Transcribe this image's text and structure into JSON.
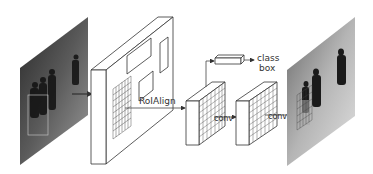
{
  "diagram": {
    "type": "architecture-pipeline",
    "nodes": [
      {
        "id": "input-image",
        "kind": "photo",
        "description": "grayscale soccer players input image"
      },
      {
        "id": "feature-map",
        "kind": "3d-block",
        "description": "backbone feature map with region proposals and grid"
      },
      {
        "id": "roi-feature-1",
        "kind": "3d-block-grid"
      },
      {
        "id": "roi-feature-2",
        "kind": "3d-block-grid"
      },
      {
        "id": "fc-head",
        "kind": "thin-3d-box"
      },
      {
        "id": "output-image",
        "kind": "photo",
        "description": "grayscale output image with instance mask"
      }
    ],
    "labels": {
      "roialign": "RoIAlign",
      "conv1": "conv",
      "conv2": "conv",
      "class": "class",
      "box": "box"
    },
    "edges": [
      {
        "from": "input-image",
        "to": "feature-map"
      },
      {
        "from": "feature-map",
        "to": "roi-feature-1",
        "label": "RoIAlign"
      },
      {
        "from": "roi-feature-1",
        "to": "fc-head"
      },
      {
        "from": "fc-head",
        "to": "class/box"
      },
      {
        "from": "roi-feature-1",
        "to": "roi-feature-2",
        "label": "conv"
      },
      {
        "from": "roi-feature-2",
        "to": "output-image",
        "label": "conv"
      }
    ]
  }
}
